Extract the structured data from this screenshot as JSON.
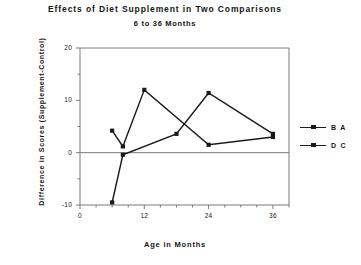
{
  "chart_data": {
    "type": "line",
    "title": "Effects of Diet Supplement in Two Comparisons",
    "subtitle": "6 to 36 Months",
    "xlabel": "Age in Months",
    "ylabel": "Difference in Scores (Supplement-Control)",
    "xlim": [
      0,
      39
    ],
    "ylim": [
      -10,
      20
    ],
    "xticks": [
      0,
      12,
      24,
      36
    ],
    "xtick_labels": [
      "0",
      "12",
      "24",
      "36"
    ],
    "yticks": [
      -10,
      0,
      10,
      20
    ],
    "ytick_labels": [
      "-10",
      "0",
      "10",
      "20"
    ],
    "x_minor_tick_step": 3,
    "y_minor_tick_step": 5,
    "grid": false,
    "zero_line": true,
    "legend_position": "right",
    "series": [
      {
        "name": "B A",
        "marker": "square",
        "color": "#1a1a1a",
        "points": [
          {
            "x": 6,
            "y": 4.2
          },
          {
            "x": 8,
            "y": 1.2
          },
          {
            "x": 12,
            "y": 12.0
          },
          {
            "x": 24,
            "y": 1.5
          },
          {
            "x": 36,
            "y": 3.0
          }
        ]
      },
      {
        "name": "D C",
        "marker": "square",
        "color": "#1a1a1a",
        "points": [
          {
            "x": 6,
            "y": -9.5
          },
          {
            "x": 8,
            "y": -0.4
          },
          {
            "x": 18,
            "y": 3.6
          },
          {
            "x": 24,
            "y": 11.4
          },
          {
            "x": 36,
            "y": 3.6
          }
        ]
      }
    ]
  },
  "legend": {
    "entries": [
      {
        "label": "B A"
      },
      {
        "label": "D C"
      }
    ]
  }
}
